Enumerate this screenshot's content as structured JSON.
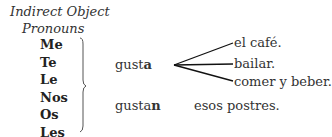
{
  "heading": {
    "line1": "Indirect Object",
    "line2": "Pronouns"
  },
  "pronouns": [
    "Me",
    "Te",
    "Le",
    "Nos",
    "Os",
    "Les"
  ],
  "singular": {
    "verb_stem": "gust",
    "verb_ending": "a",
    "objects": [
      "el café.",
      "bailar.",
      "comer y beber."
    ]
  },
  "plural": {
    "verb_stem": "gusta",
    "verb_ending": "n",
    "object": "esos postres."
  }
}
